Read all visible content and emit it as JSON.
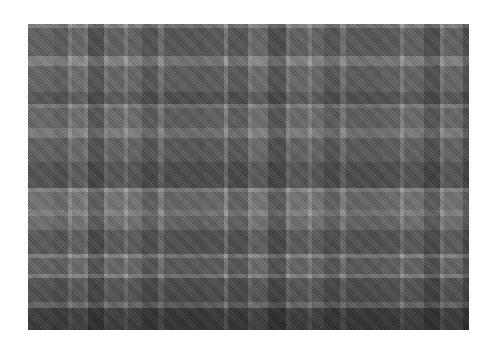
{
  "image": {
    "description": "Grayscale tartan plaid fabric texture",
    "base_color": "#7a7a7a",
    "vertical_bands": [
      {
        "x": 0,
        "w": 26,
        "color": "#7c7c7c"
      },
      {
        "x": 26,
        "w": 14,
        "color": "#6a6a6a"
      },
      {
        "x": 40,
        "w": 4,
        "color": "#b0b0b0"
      },
      {
        "x": 44,
        "w": 12,
        "color": "#8a8a8a"
      },
      {
        "x": 56,
        "w": 4,
        "color": "#a8a8a8"
      },
      {
        "x": 60,
        "w": 16,
        "color": "#4e4e4e"
      },
      {
        "x": 76,
        "w": 4,
        "color": "#a0a0a0"
      },
      {
        "x": 80,
        "w": 16,
        "color": "#7e7e7e"
      },
      {
        "x": 96,
        "w": 4,
        "color": "#b4b4b4"
      },
      {
        "x": 100,
        "w": 14,
        "color": "#808080"
      },
      {
        "x": 114,
        "w": 16,
        "color": "#555555"
      },
      {
        "x": 130,
        "w": 6,
        "color": "#9a9a9a"
      },
      {
        "x": 136,
        "w": 34,
        "color": "#606060"
      },
      {
        "x": 170,
        "w": 6,
        "color": "#5a5a5a"
      },
      {
        "x": 176,
        "w": 20,
        "color": "#656565"
      },
      {
        "x": 196,
        "w": 4,
        "color": "#b0b0b0"
      },
      {
        "x": 200,
        "w": 20,
        "color": "#5c5c5c"
      },
      {
        "x": 220,
        "w": 4,
        "color": "#a8a8a8"
      },
      {
        "x": 224,
        "w": 16,
        "color": "#8a8a8a"
      },
      {
        "x": 240,
        "w": 18,
        "color": "#4a4a4a"
      },
      {
        "x": 258,
        "w": 4,
        "color": "#a6a6a6"
      },
      {
        "x": 262,
        "w": 18,
        "color": "#7e7e7e"
      },
      {
        "x": 280,
        "w": 4,
        "color": "#b2b2b2"
      },
      {
        "x": 284,
        "w": 12,
        "color": "#808080"
      },
      {
        "x": 296,
        "w": 16,
        "color": "#575757"
      },
      {
        "x": 312,
        "w": 6,
        "color": "#9a9a9a"
      },
      {
        "x": 318,
        "w": 36,
        "color": "#626262"
      },
      {
        "x": 354,
        "w": 18,
        "color": "#6a6a6a"
      },
      {
        "x": 372,
        "w": 4,
        "color": "#b0b0b0"
      },
      {
        "x": 376,
        "w": 20,
        "color": "#7a7a7a"
      },
      {
        "x": 396,
        "w": 16,
        "color": "#484848"
      },
      {
        "x": 412,
        "w": 4,
        "color": "#a8a8a8"
      },
      {
        "x": 416,
        "w": 25,
        "color": "#7c7c7c"
      }
    ],
    "horizontal_bands": [
      {
        "y": 0,
        "w": 4,
        "color": "#a4a4a4"
      },
      {
        "y": 4,
        "w": 28,
        "color": "#6c6c6c"
      },
      {
        "y": 32,
        "w": 10,
        "color": "#a8a8a8"
      },
      {
        "y": 42,
        "w": 26,
        "color": "#757575"
      },
      {
        "y": 68,
        "w": 12,
        "color": "#5a5a5a"
      },
      {
        "y": 80,
        "w": 4,
        "color": "#a0a0a0"
      },
      {
        "y": 84,
        "w": 20,
        "color": "#7a7a7a"
      },
      {
        "y": 104,
        "w": 10,
        "color": "#9c9c9c"
      },
      {
        "y": 114,
        "w": 24,
        "color": "#6e6e6e"
      },
      {
        "y": 138,
        "w": 26,
        "color": "#555555"
      },
      {
        "y": 164,
        "w": 4,
        "color": "#b0b0b0"
      },
      {
        "y": 168,
        "w": 18,
        "color": "#8a8a8a"
      },
      {
        "y": 186,
        "w": 6,
        "color": "#a6a6a6"
      },
      {
        "y": 192,
        "w": 14,
        "color": "#848484"
      },
      {
        "y": 206,
        "w": 24,
        "color": "#5e5e5e"
      },
      {
        "y": 230,
        "w": 4,
        "color": "#a8a8a8"
      },
      {
        "y": 234,
        "w": 16,
        "color": "#707070"
      },
      {
        "y": 250,
        "w": 4,
        "color": "#a4a4a4"
      },
      {
        "y": 254,
        "w": 24,
        "color": "#5a5a5a"
      },
      {
        "y": 278,
        "w": 6,
        "color": "#8a8a8a"
      },
      {
        "y": 284,
        "w": 22,
        "color": "#3e3e3e"
      }
    ]
  }
}
